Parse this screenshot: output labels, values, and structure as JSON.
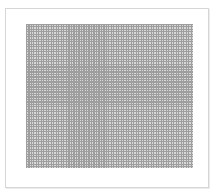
{
  "figure": {
    "caption_top": "",
    "caption_bottom": "",
    "grid": {
      "columns": 66,
      "rows": 57,
      "line_color": "#8e8e8e",
      "cell_color": "#d2d2d2"
    },
    "frame_border_color": "#d6d6d6"
  }
}
